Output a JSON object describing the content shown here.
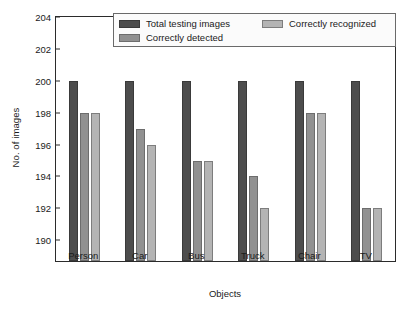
{
  "chart_data": {
    "type": "bar",
    "title": "",
    "xlabel": "Objects",
    "ylabel": "No. of images",
    "categories": [
      "Person",
      "Car",
      "Bus",
      "Truck",
      "Chair",
      "TV"
    ],
    "series": [
      {
        "name": "Total testing images",
        "color": "#4d4d4d",
        "values": [
          200,
          200,
          200,
          200,
          200,
          200
        ]
      },
      {
        "name": "Correctly detected",
        "color": "#919191",
        "values": [
          198,
          197,
          195,
          194,
          198,
          192
        ]
      },
      {
        "name": "Correctly recognized",
        "color": "#b4b4b4",
        "values": [
          198,
          196,
          195,
          192,
          198,
          192
        ]
      }
    ],
    "ylim": [
      188.7,
      204
    ],
    "yticks": [
      190,
      192,
      194,
      196,
      198,
      200,
      202,
      204
    ],
    "ytick_labels": [
      "190",
      "192",
      "194",
      "196",
      "198",
      "200",
      "202",
      "204"
    ],
    "grid": false,
    "legend_position": "upper-center"
  },
  "axes": {
    "ylabel": "No. of images",
    "xlabel": "Objects"
  },
  "legend": {
    "entries": [
      {
        "label": "Total testing images"
      },
      {
        "label": "Correctly detected"
      },
      {
        "label": "Correctly recognized"
      }
    ]
  }
}
